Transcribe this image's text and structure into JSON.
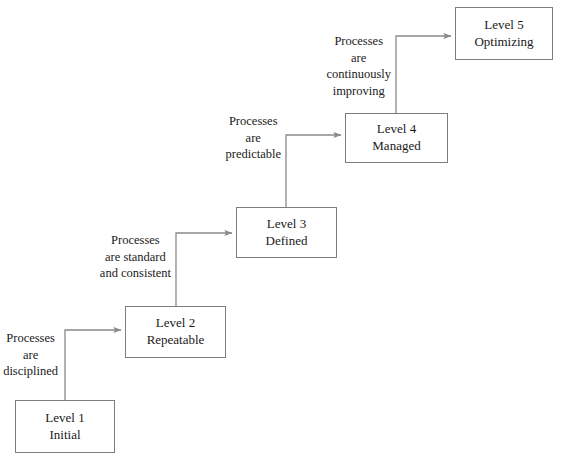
{
  "diagram": {
    "colors": {
      "background": "#ffffff",
      "box_border": "#7d7d7d",
      "connector": "#8a8a8a",
      "text": "#1a1a1a"
    },
    "nodes": [
      {
        "id": "level1",
        "line1": "Level 1",
        "line2": "Initial",
        "x": 15,
        "y": 400,
        "w": 100,
        "h": 53
      },
      {
        "id": "level2",
        "line1": "Level 2",
        "line2": "Repeatable",
        "x": 125,
        "y": 306,
        "w": 101,
        "h": 52
      },
      {
        "id": "level3",
        "line1": "Level 3",
        "line2": "Defined",
        "x": 236,
        "y": 207,
        "w": 101,
        "h": 51
      },
      {
        "id": "level4",
        "line1": "Level 4",
        "line2": "Managed",
        "x": 345,
        "y": 113,
        "w": 103,
        "h": 50
      },
      {
        "id": "level5",
        "line1": "Level 5",
        "line2": "Optimizing",
        "x": 455,
        "y": 7,
        "w": 98,
        "h": 53
      }
    ],
    "edge_labels": [
      {
        "id": "label-disciplined",
        "lines": [
          "Processes",
          "are",
          "disciplined"
        ],
        "right": 513,
        "y": 330
      },
      {
        "id": "label-standard",
        "lines": [
          "Processes",
          "are standard",
          "and consistent"
        ],
        "right": 400,
        "y": 232
      },
      {
        "id": "label-predictable",
        "lines": [
          "Processes",
          "are",
          "predictable"
        ],
        "right": 290,
        "y": 113
      },
      {
        "id": "label-improving",
        "lines": [
          "Processes",
          "are",
          "continuously",
          "improving"
        ],
        "right": 180,
        "y": 33
      }
    ],
    "connectors": [
      {
        "id": "connector-1-to-2",
        "from": "level1",
        "to": "level2",
        "riser_x": 65,
        "elbow_y": 330,
        "arrow_x": 125,
        "start_y": 400
      },
      {
        "id": "connector-2-to-3",
        "from": "level2",
        "to": "level3",
        "riser_x": 176,
        "elbow_y": 233,
        "arrow_x": 236,
        "start_y": 306
      },
      {
        "id": "connector-3-to-4",
        "from": "level3",
        "to": "level4",
        "riser_x": 286,
        "elbow_y": 135,
        "arrow_x": 345,
        "start_y": 207
      },
      {
        "id": "connector-4-to-5",
        "from": "level4",
        "to": "level5",
        "riser_x": 396,
        "elbow_y": 36,
        "arrow_x": 455,
        "start_y": 113
      }
    ]
  }
}
